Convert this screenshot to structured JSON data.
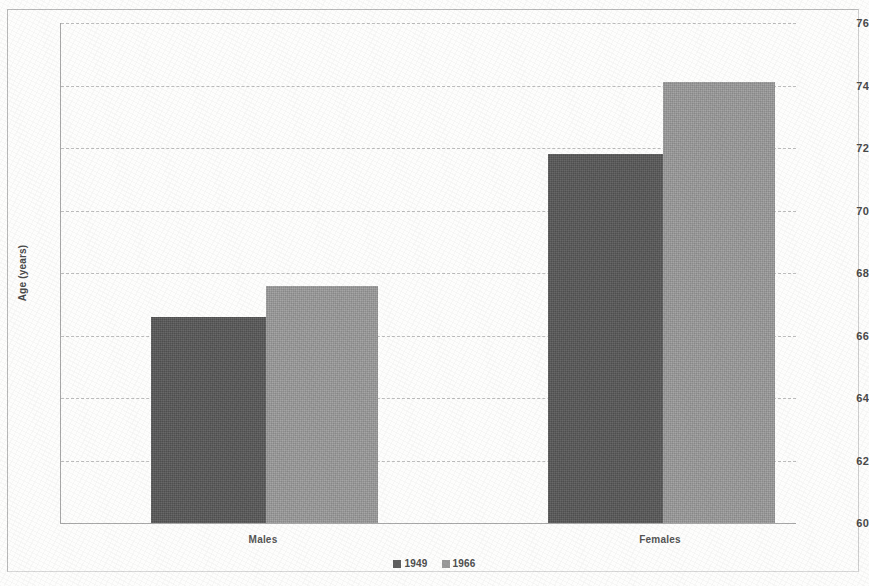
{
  "chart_data": {
    "type": "bar",
    "title": "",
    "xlabel": "",
    "ylabel": "Age (years)",
    "ylim": [
      60,
      76
    ],
    "ytick_step": 2,
    "yticks": [
      60,
      62,
      64,
      66,
      68,
      70,
      72,
      74,
      76
    ],
    "categories": [
      "Males",
      "Females"
    ],
    "series": [
      {
        "name": "1949",
        "color": "#585858",
        "values": [
          66.6,
          71.8
        ]
      },
      {
        "name": "1966",
        "color": "#9a9a9a",
        "values": [
          67.6,
          74.1
        ]
      }
    ],
    "grid": "horizontal-dashed",
    "legend_position": "bottom-center"
  },
  "axis": {
    "y_title": "Age (years)",
    "tick_labels": [
      "76",
      "74",
      "72",
      "70",
      "68",
      "66",
      "64",
      "62",
      "60"
    ]
  },
  "categories": [
    {
      "label": "Males"
    },
    {
      "label": "Females"
    }
  ],
  "legend": {
    "items": [
      {
        "label": "1949"
      },
      {
        "label": "1966"
      }
    ]
  }
}
